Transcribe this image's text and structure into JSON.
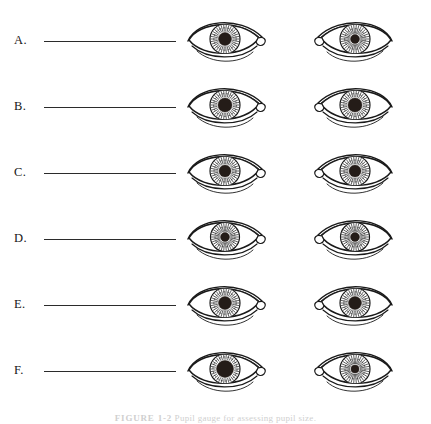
{
  "figure": {
    "caption_figure_number": "FIGURE 1-2",
    "caption_text": "Pupil gauge for assessing pupil size.",
    "ink_color": "#1a1a1a",
    "pupil_color": "#241c18",
    "page_background": "#ffffff"
  },
  "rows": [
    {
      "label": "A.",
      "answer_line_value": "",
      "left_eye": {
        "side": "left",
        "pupil_size": "large",
        "pupil_diameter_px": 13,
        "iris_diameter_px": 30
      },
      "right_eye": {
        "side": "right",
        "pupil_size": "small",
        "pupil_diameter_px": 9,
        "iris_diameter_px": 30
      }
    },
    {
      "label": "B.",
      "answer_line_value": "",
      "left_eye": {
        "side": "left",
        "pupil_size": "large",
        "pupil_diameter_px": 14,
        "iris_diameter_px": 30
      },
      "right_eye": {
        "side": "right",
        "pupil_size": "large",
        "pupil_diameter_px": 14,
        "iris_diameter_px": 30
      }
    },
    {
      "label": "C.",
      "answer_line_value": "",
      "left_eye": {
        "side": "left",
        "pupil_size": "medium",
        "pupil_diameter_px": 12,
        "iris_diameter_px": 30
      },
      "right_eye": {
        "side": "right",
        "pupil_size": "medium",
        "pupil_diameter_px": 12,
        "iris_diameter_px": 30
      }
    },
    {
      "label": "D.",
      "answer_line_value": "",
      "left_eye": {
        "side": "left",
        "pupil_size": "small",
        "pupil_diameter_px": 9,
        "iris_diameter_px": 29
      },
      "right_eye": {
        "side": "right",
        "pupil_size": "small",
        "pupil_diameter_px": 9,
        "iris_diameter_px": 29
      }
    },
    {
      "label": "E.",
      "answer_line_value": "",
      "left_eye": {
        "side": "left",
        "pupil_size": "medium-large",
        "pupil_diameter_px": 13,
        "iris_diameter_px": 30
      },
      "right_eye": {
        "side": "right",
        "pupil_size": "medium-large",
        "pupil_diameter_px": 13,
        "iris_diameter_px": 30
      }
    },
    {
      "label": "F.",
      "answer_line_value": "",
      "left_eye": {
        "side": "left",
        "pupil_size": "very-large",
        "pupil_diameter_px": 17,
        "iris_diameter_px": 30
      },
      "right_eye": {
        "side": "right",
        "pupil_size": "small",
        "pupil_diameter_px": 8,
        "iris_diameter_px": 30
      }
    }
  ]
}
